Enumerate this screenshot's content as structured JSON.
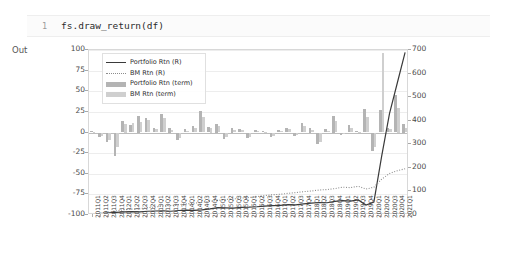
{
  "notebook": {
    "cell_line_number": "1",
    "code": "fs.draw_return(df)",
    "output_label": "Out"
  },
  "colors": {
    "portfolio_line": "#3a3a3a",
    "bm_line": "#8c8c8c",
    "portfolio_bar": "#b4b4b4",
    "bm_bar": "#cfcfcf",
    "grid": "#ededed",
    "axis": "#d8d8d8"
  },
  "legend": {
    "position": "upper-left",
    "items": [
      {
        "label": "Portfolio Rtn (R)",
        "key": "solid-line",
        "color": "#3a3a3a"
      },
      {
        "label": "BM Rtn (R)",
        "key": "dotted-line",
        "color": "#8c8c8c"
      },
      {
        "label": "Portfolio Rtn (term)",
        "key": "bar-patch",
        "color": "#b4b4b4"
      },
      {
        "label": "BM Rtn (term)",
        "key": "bar-patch",
        "color": "#cfcfcf"
      }
    ]
  },
  "chart_data": {
    "type": "line",
    "title": "",
    "xlabel": "",
    "ylabel": "",
    "grid": true,
    "legend_position": "upper left",
    "left_axis": {
      "label": "",
      "ylim": [
        -100,
        100
      ],
      "ticks": [
        100,
        75,
        50,
        25,
        0,
        -25,
        -50,
        -75,
        -100
      ],
      "tick_labels": [
        "100",
        "75",
        "50",
        "25",
        "0",
        "-25",
        "-50",
        "-75",
        "-100"
      ],
      "series_assigned": [
        "Portfolio Rtn (term)",
        "BM Rtn (term)"
      ]
    },
    "right_axis": {
      "label": "",
      "ylim": [
        0,
        700
      ],
      "ticks": [
        700,
        600,
        500,
        400,
        300,
        200,
        100,
        0
      ],
      "tick_labels": [
        "700",
        "600",
        "500",
        "400",
        "300",
        "200",
        "100",
        "0"
      ],
      "series_assigned": [
        "Portfolio Rtn (R)",
        "BM Rtn (R)"
      ]
    },
    "categories": [
      "2011Q1",
      "2011Q2",
      "2011Q3",
      "2011Q4",
      "2012Q1",
      "2012Q2",
      "2012Q3",
      "2012Q4",
      "2013Q1",
      "2013Q2",
      "2013Q3",
      "2013Q4",
      "2014Q1",
      "2014Q2",
      "2014Q3",
      "2014Q4",
      "2015Q1",
      "2015Q2",
      "2015Q3",
      "2015Q4",
      "2016Q1",
      "2016Q2",
      "2016Q3",
      "2016Q4",
      "2017Q1",
      "2017Q2",
      "2017Q3",
      "2017Q4",
      "2018Q1",
      "2018Q2",
      "2018Q3",
      "2018Q4",
      "2019Q1",
      "2019Q2",
      "2019Q3",
      "2019Q4",
      "2020Q1",
      "2020Q2",
      "2020Q3",
      "2020Q4",
      "2021Q1"
    ],
    "series": [
      {
        "name": "Portfolio Rtn (term)",
        "type": "bar",
        "axis": "left",
        "color": "#b4b4b4",
        "values": [
          2,
          -6,
          -12,
          -28,
          14,
          9,
          20,
          18,
          6,
          22,
          5,
          -9,
          4,
          8,
          26,
          7,
          10,
          -8,
          5,
          4,
          -7,
          3,
          2,
          -5,
          3,
          6,
          -4,
          12,
          5,
          -14,
          4,
          20,
          -3,
          9,
          2,
          28,
          -23,
          27,
          6,
          46,
          10
        ]
      },
      {
        "name": "BM Rtn (term)",
        "type": "bar",
        "axis": "left",
        "color": "#cfcfcf",
        "values": [
          1,
          -4,
          -9,
          -18,
          10,
          11,
          13,
          15,
          4,
          17,
          3,
          -7,
          2,
          6,
          19,
          5,
          8,
          -6,
          3,
          3,
          -5,
          2,
          1,
          -4,
          2,
          4,
          -3,
          8,
          3,
          -11,
          2,
          14,
          -2,
          6,
          1,
          19,
          -17,
          96,
          4,
          30,
          6
        ]
      },
      {
        "name": "Portfolio Rtn (R)",
        "type": "line",
        "style": "solid",
        "axis": "right",
        "color": "#3a3a3a",
        "values": [
          0,
          6,
          9,
          11,
          13,
          14,
          13,
          16,
          17,
          18,
          16,
          19,
          21,
          20,
          22,
          26,
          31,
          30,
          29,
          32,
          33,
          35,
          38,
          40,
          41,
          44,
          43,
          47,
          50,
          53,
          52,
          58,
          61,
          59,
          64,
          42,
          55,
          250,
          430,
          560,
          690
        ]
      },
      {
        "name": "BM Rtn (R)",
        "type": "line",
        "style": "dotted",
        "axis": "right",
        "color": "#8c8c8c",
        "values": [
          0,
          8,
          13,
          18,
          22,
          25,
          27,
          31,
          34,
          38,
          40,
          44,
          47,
          50,
          54,
          58,
          62,
          66,
          68,
          72,
          74,
          78,
          82,
          86,
          88,
          92,
          95,
          99,
          102,
          106,
          108,
          112,
          118,
          116,
          122,
          110,
          118,
          152,
          176,
          188,
          196
        ]
      }
    ]
  }
}
